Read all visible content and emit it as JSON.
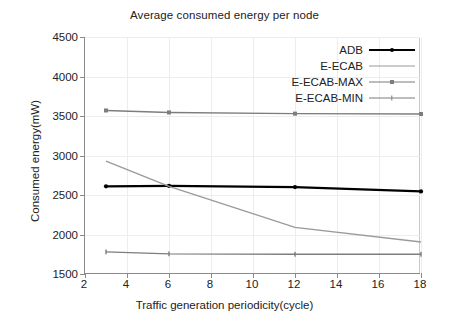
{
  "chart_data": {
    "type": "line",
    "title": "Average consumed energy per node",
    "xlabel": "Traffic generation periodicity(cycle)",
    "ylabel": "Consumed energy(mW)",
    "xlim": [
      2,
      18
    ],
    "ylim": [
      1500,
      4500
    ],
    "xticks": [
      2,
      4,
      6,
      8,
      10,
      12,
      14,
      16,
      18
    ],
    "yticks": [
      1500,
      2000,
      2500,
      3000,
      3500,
      4000,
      4500
    ],
    "grid": true,
    "legend_position": "upper right (inside axes)",
    "x": [
      3,
      6,
      12,
      18
    ],
    "series": [
      {
        "name": "ADB",
        "color": "#000000",
        "marker": "dot",
        "linewidth": 2.2,
        "values": [
          2610,
          2615,
          2600,
          2545
        ]
      },
      {
        "name": "E-ECAB",
        "color": "#9a9a9a",
        "marker": "none",
        "linewidth": 1.4,
        "values": [
          2930,
          2610,
          2090,
          1905
        ]
      },
      {
        "name": "E-ECAB-MAX",
        "color": "#7d7d7d",
        "marker": "square",
        "linewidth": 1.4,
        "values": [
          3570,
          3545,
          3530,
          3525
        ]
      },
      {
        "name": "E-ECAB-MIN",
        "color": "#7d7d7d",
        "marker": "tick",
        "linewidth": 1.4,
        "values": [
          1780,
          1755,
          1750,
          1750
        ]
      }
    ]
  },
  "legend": {
    "entries": [
      {
        "label": "ADB"
      },
      {
        "label": "E-ECAB"
      },
      {
        "label": "E-ECAB-MAX"
      },
      {
        "label": "E-ECAB-MIN"
      }
    ]
  },
  "colors": {
    "background": "#ffffff",
    "axis": "#8a8a8a",
    "grid": "#ededed",
    "text": "#222222"
  }
}
